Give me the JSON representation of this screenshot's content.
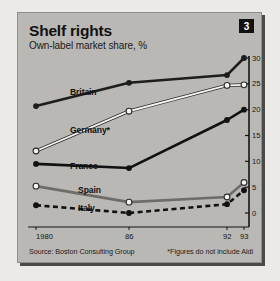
{
  "header": {
    "title": "Shelf rights",
    "subtitle": "Own-label market share, %",
    "badge": "3"
  },
  "footer": {
    "source": "Source: Boston Consulting Group",
    "note": "*Figures do not include Aldi"
  },
  "chart_data": {
    "type": "line",
    "title": "Shelf rights",
    "subtitle": "Own-label market share, %",
    "xlabel": "",
    "ylabel": "%",
    "x": [
      1980,
      1986,
      1992,
      1993
    ],
    "categories": [
      "1980",
      "86",
      "92",
      "93"
    ],
    "xticklabels": [
      "1980",
      "86",
      "92",
      "93"
    ],
    "yticklabels": [
      "0",
      "5",
      "10",
      "15",
      "20",
      "25",
      "30"
    ],
    "ylim": [
      0,
      30
    ],
    "ytick_step": 5,
    "y_axis_position": "right",
    "grid": false,
    "legend": "inline-labels",
    "series": [
      {
        "name": "Britain",
        "values": [
          20.7,
          25.2,
          26.7,
          30.0
        ],
        "color": "#1d1d1d",
        "marker": "filled-circle",
        "dash": "solid"
      },
      {
        "name": "Germany*",
        "values": [
          12.0,
          19.7,
          24.7,
          24.8
        ],
        "color": "#f5f4f0",
        "marker": "hollow-circle",
        "dash": "solid"
      },
      {
        "name": "France",
        "values": [
          9.5,
          8.7,
          18.0,
          20.0
        ],
        "color": "#111111",
        "marker": "filled-circle",
        "dash": "solid"
      },
      {
        "name": "Spain",
        "values": [
          5.2,
          2.1,
          3.1,
          5.9
        ],
        "color": "#6d6c68",
        "marker": "hollow-circle",
        "dash": "solid"
      },
      {
        "name": "Italy",
        "values": [
          1.5,
          0.0,
          1.7,
          4.4
        ],
        "color": "#111111",
        "marker": "filled-circle",
        "dash": "dashed"
      }
    ]
  },
  "series_labels": [
    {
      "text": "Britain",
      "x": 52,
      "y": 74
    },
    {
      "text": "Germany*",
      "x": 52,
      "y": 112
    },
    {
      "text": "France",
      "x": 52,
      "y": 148
    },
    {
      "text": "Spain",
      "x": 60,
      "y": 172
    },
    {
      "text": "Italy",
      "x": 60,
      "y": 190
    }
  ]
}
